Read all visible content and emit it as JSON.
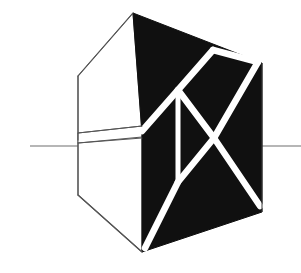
{
  "figure": {
    "title": "Folded Polyhedral Form with Diagonal Bracing",
    "kind": "geometric-line-drawing",
    "canvas": {
      "width": 301,
      "height": 273,
      "background": "#ffffff"
    },
    "colors": {
      "fill_dark": "#101010",
      "fill_light": "#ffffff",
      "outline": "#555555",
      "strut": "#ffffff",
      "ground_line": "#6e6e6e"
    },
    "stroke_widths": {
      "outline": 1.1,
      "strut": 6.5,
      "ground_line": 1.2
    },
    "parts": [
      {
        "name": "dark-face",
        "label": "Solid dark quadrilateral face",
        "fill": "#101010"
      },
      {
        "name": "light-face",
        "label": "Unfilled light side face",
        "fill": "#ffffff"
      },
      {
        "name": "wedge-flap",
        "label": "Thin folded flap wedge",
        "fill": "#ffffff"
      },
      {
        "name": "strut-network",
        "label": "White zigzag bracing struts",
        "stroke": "#ffffff"
      },
      {
        "name": "ground-line",
        "label": "Horizontal datum line",
        "stroke": "#6e6e6e"
      }
    ],
    "geometry": {
      "dark_face_polygon": "133,13 262,63 262,212 142,252 142,133",
      "light_face_polygon": "133,13 78,76 78,195 142,252 142,133 78,140 78,133",
      "wedge_flap_polygon": "78,133 142,126 142,137 78,143",
      "light_face_edges": [
        "133,13 78,76",
        "78,76 78,140",
        "78,143 78,195",
        "78,195 142,252",
        "133,13 142,126"
      ],
      "dark_face_edges": [
        "133,13 262,63",
        "262,63 262,212",
        "262,212 142,252",
        "142,252 142,133"
      ],
      "wedge_edges": [
        "78,133 142,126",
        "78,143 142,137"
      ],
      "ground_line_left": "30,146 78,146",
      "ground_line_right": "262,146 301,146",
      "struts": [
        {
          "name": "strut-upper-left-diagonal",
          "path": "142,131 178,90"
        },
        {
          "name": "strut-upper-right-rise",
          "path": "178,90 213,50"
        },
        {
          "name": "strut-vertical-center",
          "path": "178,92 178,182"
        },
        {
          "name": "strut-top-right-down",
          "path": "213,50 258,62"
        },
        {
          "name": "strut-upper-mid-cross-a",
          "path": "178,90 214,138"
        },
        {
          "name": "strut-upper-mid-cross-b",
          "path": "214,138 258,62"
        },
        {
          "name": "strut-lower-cross-a",
          "path": "214,138 178,182"
        },
        {
          "name": "strut-lower-cross-b",
          "path": "214,138 260,206"
        },
        {
          "name": "strut-lower-left-descend",
          "path": "178,182 145,248"
        }
      ],
      "nodes": [
        {
          "name": "node-apex-top",
          "x": 133,
          "y": 13
        },
        {
          "name": "node-upper-left-joint",
          "x": 178,
          "y": 90
        },
        {
          "name": "node-top-right-joint",
          "x": 213,
          "y": 50
        },
        {
          "name": "node-center-cross",
          "x": 214,
          "y": 138
        },
        {
          "name": "node-lower-center",
          "x": 178,
          "y": 182
        },
        {
          "name": "node-bottom-left",
          "x": 142,
          "y": 252
        },
        {
          "name": "node-bottom-right",
          "x": 262,
          "y": 212
        },
        {
          "name": "node-right-upper",
          "x": 262,
          "y": 63
        }
      ]
    }
  }
}
